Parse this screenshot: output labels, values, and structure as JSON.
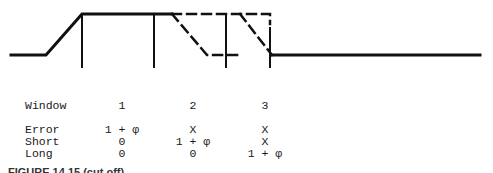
{
  "diagram": {
    "stroke_color": "#111111"
  },
  "table": {
    "header": {
      "label": "Window",
      "cols": [
        "1",
        "2",
        "3"
      ]
    },
    "rows": [
      {
        "label": "Error",
        "values": [
          "1 + φ",
          "X",
          "X"
        ]
      },
      {
        "label": "Short",
        "values": [
          "0",
          "1 + φ",
          "X"
        ]
      },
      {
        "label": "Long",
        "values": [
          "0",
          "0",
          "1 + φ"
        ]
      }
    ]
  },
  "caption": "FIGURE 14.15 (cut off)"
}
